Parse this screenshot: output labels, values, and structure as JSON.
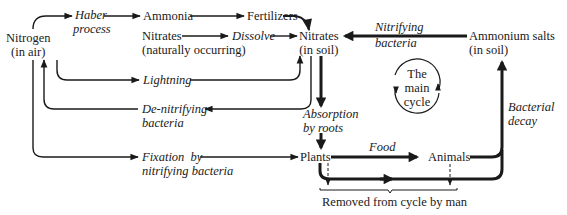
{
  "nodes": {
    "nitrogen_air": [
      "Nitrogen",
      "(in air)"
    ],
    "ammonia": "Ammonia",
    "fertilizers": "Fertilizers",
    "nitrates_natural": [
      "Nitrates",
      "(naturally occurring)"
    ],
    "nitrates_soil": [
      "Nitrates",
      "(in soil)"
    ],
    "ammonium_salts": [
      "Ammonium salts",
      "(in soil)"
    ],
    "plants": "Plants",
    "animals": "Animals"
  },
  "processes": {
    "haber": [
      "Haber",
      "process"
    ],
    "dissolve": "Dissolve",
    "lightning": "Lightning",
    "denitrifying": [
      "De-nitrifying",
      "bacteria"
    ],
    "nitrifying": [
      "Nitrifying",
      "bacteria"
    ],
    "absorption": [
      "Absorption",
      "by roots"
    ],
    "fixation": [
      "Fixation  by",
      "nitrifying bacteria"
    ],
    "food": "Food",
    "bacterial_decay": [
      "Bacterial",
      "decay"
    ]
  },
  "main_cycle": [
    "The",
    "main",
    "cycle"
  ],
  "removed_label": "Removed from cycle by man",
  "colors": {
    "ink": "#1a1a1a",
    "background": "#ffffff"
  }
}
